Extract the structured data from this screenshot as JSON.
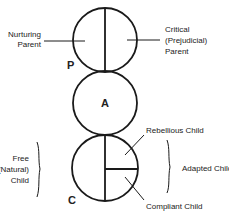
{
  "diagram": {
    "ego_states": [
      {
        "id": "parent",
        "letter": "P"
      },
      {
        "id": "adult",
        "letter": "A"
      },
      {
        "id": "child",
        "letter": "C"
      }
    ],
    "parent_labels": {
      "left": [
        "Nurturing",
        "Parent"
      ],
      "right": [
        "Critical",
        "(Prejudicial)",
        "Parent"
      ]
    },
    "child_labels": {
      "free": [
        "Free",
        "(Natural)",
        "Child"
      ],
      "rebellious": "Rebellious Child",
      "compliant": "Compliant Child",
      "adapted": "Adapted Child"
    },
    "colors": {
      "line": "#1a1a1a",
      "text": "#222222",
      "background": "#ffffff"
    }
  }
}
